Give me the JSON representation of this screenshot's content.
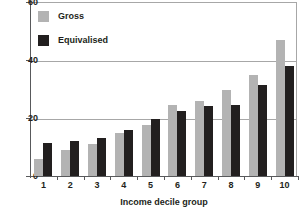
{
  "chart_data": {
    "type": "bar",
    "title": "",
    "xlabel": "Income decile group",
    "ylabel": "",
    "ylim": [
      0,
      60
    ],
    "yticks": [
      0,
      20,
      40,
      60
    ],
    "ytick_labels": [
      "0",
      "20",
      "40",
      "60"
    ],
    "grid": true,
    "legend_position": "top-left",
    "categories": [
      "1",
      "2",
      "3",
      "4",
      "5",
      "6",
      "7",
      "8",
      "9",
      "10"
    ],
    "series": [
      {
        "name": "Gross",
        "color": "#b3b3b3",
        "values": [
          6,
          9,
          11,
          15,
          17.5,
          24.5,
          26,
          29.5,
          35,
          47
        ]
      },
      {
        "name": "Equivalised",
        "color": "#221f1f",
        "values": [
          11.5,
          12,
          13,
          16,
          19.5,
          22.5,
          24,
          24.5,
          31.5,
          38
        ]
      }
    ]
  },
  "legend": {
    "items": [
      {
        "label": "Gross",
        "swatch": "gross"
      },
      {
        "label": "Equivalised",
        "swatch": "equiv"
      }
    ]
  },
  "axes": {
    "x_title": "Income decile group"
  }
}
